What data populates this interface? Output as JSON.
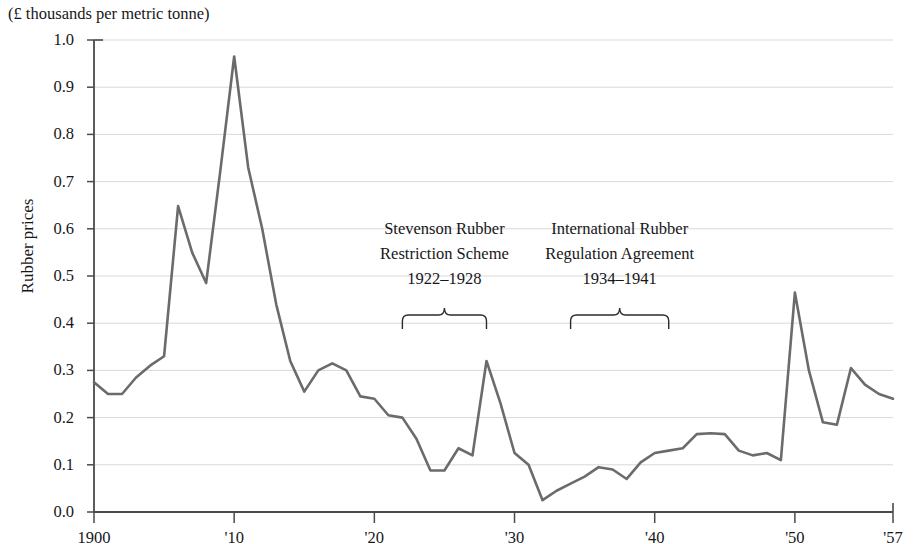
{
  "chart_data": {
    "type": "line",
    "title": "",
    "unit_caption": "(£ thousands per metric tonne)",
    "ylabel": "Rubber prices",
    "xlabel": "",
    "ylim": [
      0.0,
      1.0
    ],
    "xlim": [
      1900,
      1957
    ],
    "grid": true,
    "legend_position": "none",
    "y_ticks": [
      "1.0",
      "0.9",
      "0.8",
      "0.7",
      "0.6",
      "0.5",
      "0.4",
      "0.3",
      "0.2",
      "0.1",
      "0.0"
    ],
    "y_tick_values": [
      1.0,
      0.9,
      0.8,
      0.7,
      0.6,
      0.5,
      0.4,
      0.3,
      0.2,
      0.1,
      0.0
    ],
    "x_ticks": [
      "1900",
      "'10",
      "'20",
      "'30",
      "'40",
      "'50",
      "'57"
    ],
    "x_tick_values": [
      1900,
      1910,
      1920,
      1930,
      1940,
      1950,
      1957
    ],
    "series": [
      {
        "name": "Rubber prices",
        "color": "#6b6b6b",
        "x": [
          1900,
          1901,
          1902,
          1903,
          1904,
          1905,
          1906,
          1907,
          1908,
          1909,
          1910,
          1911,
          1912,
          1913,
          1914,
          1915,
          1916,
          1917,
          1918,
          1919,
          1920,
          1921,
          1922,
          1923,
          1924,
          1925,
          1926,
          1927,
          1928,
          1929,
          1930,
          1931,
          1932,
          1933,
          1934,
          1935,
          1936,
          1937,
          1938,
          1939,
          1940,
          1941,
          1942,
          1943,
          1944,
          1945,
          1946,
          1947,
          1948,
          1949,
          1950,
          1951,
          1952,
          1953,
          1954,
          1955,
          1956,
          1957
        ],
        "values": [
          0.275,
          0.25,
          0.25,
          0.285,
          0.31,
          0.33,
          0.648,
          0.55,
          0.485,
          0.72,
          0.965,
          0.73,
          0.6,
          0.44,
          0.32,
          0.255,
          0.275,
          0.3,
          0.315,
          0.3,
          0.245,
          0.24,
          0.205,
          0.2,
          0.155,
          0.088,
          0.088,
          0.135,
          0.12,
          0.16,
          0.32,
          0.23,
          0.175,
          0.125,
          0.1,
          0.095,
          0.07,
          0.045,
          0.025,
          0.045,
          0.06,
          0.075,
          0.095,
          0.09,
          0.07,
          0.105,
          0.125,
          0.13,
          0.135,
          0.165,
          0.167,
          0.165,
          0.13,
          0.12,
          0.125,
          0.11,
          0.465,
          0.245
        ]
      }
    ],
    "line_series_points": [
      {
        "year": 1900,
        "value": 0.275
      },
      {
        "year": 1901,
        "value": 0.25
      },
      {
        "year": 1902,
        "value": 0.25
      },
      {
        "year": 1903,
        "value": 0.285
      },
      {
        "year": 1904,
        "value": 0.31
      },
      {
        "year": 1905,
        "value": 0.33
      },
      {
        "year": 1906,
        "value": 0.648
      },
      {
        "year": 1907,
        "value": 0.55
      },
      {
        "year": 1908,
        "value": 0.485
      },
      {
        "year": 1909,
        "value": 0.72
      },
      {
        "year": 1910,
        "value": 0.965
      },
      {
        "year": 1911,
        "value": 0.73
      },
      {
        "year": 1912,
        "value": 0.6
      },
      {
        "year": 1913,
        "value": 0.44
      },
      {
        "year": 1914,
        "value": 0.32
      },
      {
        "year": 1915,
        "value": 0.255
      },
      {
        "year": 1916,
        "value": 0.3
      },
      {
        "year": 1917,
        "value": 0.315
      },
      {
        "year": 1918,
        "value": 0.3
      },
      {
        "year": 1919,
        "value": 0.245
      },
      {
        "year": 1920,
        "value": 0.24
      },
      {
        "year": 1921,
        "value": 0.205
      },
      {
        "year": 1922,
        "value": 0.2
      },
      {
        "year": 1923,
        "value": 0.155
      },
      {
        "year": 1924,
        "value": 0.088
      },
      {
        "year": 1925,
        "value": 0.088
      },
      {
        "year": 1926,
        "value": 0.135
      },
      {
        "year": 1927,
        "value": 0.12
      },
      {
        "year": 1928,
        "value": 0.32
      },
      {
        "year": 1929,
        "value": 0.23
      },
      {
        "year": 1930,
        "value": 0.125
      },
      {
        "year": 1931,
        "value": 0.1
      },
      {
        "year": 1932,
        "value": 0.025
      },
      {
        "year": 1933,
        "value": 0.045
      },
      {
        "year": 1934,
        "value": 0.06
      },
      {
        "year": 1935,
        "value": 0.075
      },
      {
        "year": 1936,
        "value": 0.095
      },
      {
        "year": 1937,
        "value": 0.09
      },
      {
        "year": 1938,
        "value": 0.07
      },
      {
        "year": 1939,
        "value": 0.105
      },
      {
        "year": 1940,
        "value": 0.125
      },
      {
        "year": 1941,
        "value": 0.13
      },
      {
        "year": 1942,
        "value": 0.135
      },
      {
        "year": 1943,
        "value": 0.165
      },
      {
        "year": 1944,
        "value": 0.167
      },
      {
        "year": 1945,
        "value": 0.165
      },
      {
        "year": 1946,
        "value": 0.13
      },
      {
        "year": 1947,
        "value": 0.12
      },
      {
        "year": 1948,
        "value": 0.125
      },
      {
        "year": 1949,
        "value": 0.11
      },
      {
        "year": 1950,
        "value": 0.465
      },
      {
        "year": 1951,
        "value": 0.3
      },
      {
        "year": 1952,
        "value": 0.19
      },
      {
        "year": 1953,
        "value": 0.185
      },
      {
        "year": 1954,
        "value": 0.305
      },
      {
        "year": 1955,
        "value": 0.27
      },
      {
        "year": 1956,
        "value": 0.25
      },
      {
        "year": 1957,
        "value": 0.24
      }
    ],
    "annotations": [
      {
        "id": "stevenson",
        "line1": "Stevenson Rubber",
        "line2": "Restriction Scheme",
        "line3": "1922–1928",
        "bracket_start_year": 1922,
        "bracket_end_year": 1928
      },
      {
        "id": "international",
        "line1": "International Rubber",
        "line2": "Regulation Agreement",
        "line3": "1934–1941",
        "bracket_start_year": 1934,
        "bracket_end_year": 1941
      }
    ],
    "colors": {
      "line": "#6b6b6b",
      "axis": "#4a4a4a",
      "grid": "#d9d9d9",
      "text": "#17171a"
    }
  }
}
